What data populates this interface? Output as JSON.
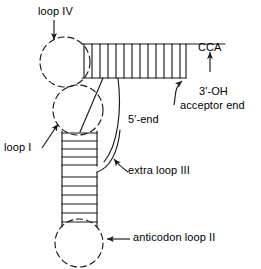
{
  "figure": {
    "stroke_color": "#1a1a1a",
    "background_color": "#ffffff",
    "labels": {
      "loop_iv": "loop IV",
      "loop_i": "loop I",
      "anticodon_loop_ii": "anticodon loop II",
      "extra_loop_iii": "extra loop III",
      "five_prime_end": "5′-end",
      "cca": "CCA",
      "three_prime_oh": "3′-OH",
      "acceptor_end": "acceptor end"
    },
    "icons": {
      "arrow_loop_iv": "arrow-down-icon",
      "arrow_loop_i": "arrow-up-right-icon",
      "arrow_anticodon": "arrow-left-icon",
      "arrow_extra_loop": "arrow-up-left-icon",
      "arrow_cca": "arrow-up-icon",
      "arrow_acceptor_end": "arrow-up-left-curved-icon",
      "leader_five_prime": "leader-line-icon"
    },
    "structure": {
      "acceptor_stem_rungs": 13,
      "d_stem_rungs": 4,
      "anticodon_stem_rungs": 5,
      "loops_dashed": 3
    }
  }
}
